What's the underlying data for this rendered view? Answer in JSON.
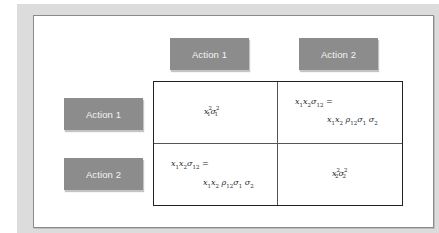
{
  "diagram": {
    "type": "covariance-payoff-matrix",
    "column_headers": [
      "Action 1",
      "Action 2"
    ],
    "row_headers": [
      "Action 1",
      "Action 2"
    ],
    "cells": {
      "r1c1": {
        "formula": "x1^2 σ1^2"
      },
      "r1c2": {
        "line1": "x1 x2 σ12 =",
        "line2": "x1 x2 ρ12 σ1 σ2"
      },
      "r2c1": {
        "line1": "x1 x2 σ12 =",
        "line2": "x1 x2 ρ12 σ1 σ2"
      },
      "r2c2": {
        "formula": "x2^2 σ2^2"
      }
    },
    "colors": {
      "button_fill": "#8c8c8c",
      "button_text": "#f4f4f4",
      "outer_background": "#dcdcdc",
      "grid_border": "#222222"
    }
  }
}
